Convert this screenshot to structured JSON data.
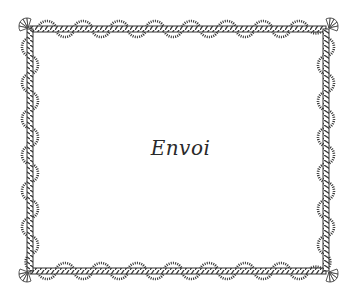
{
  "page": {
    "title": "Envoi"
  },
  "frame": {
    "style": "scalloped rope border with fan corner ornaments",
    "colors": {
      "ink": "#333333",
      "rope_light": "#ffffff",
      "background": "#ffffff"
    },
    "scallops_per_horizontal_side": 8,
    "scallops_per_vertical_side": 8
  }
}
